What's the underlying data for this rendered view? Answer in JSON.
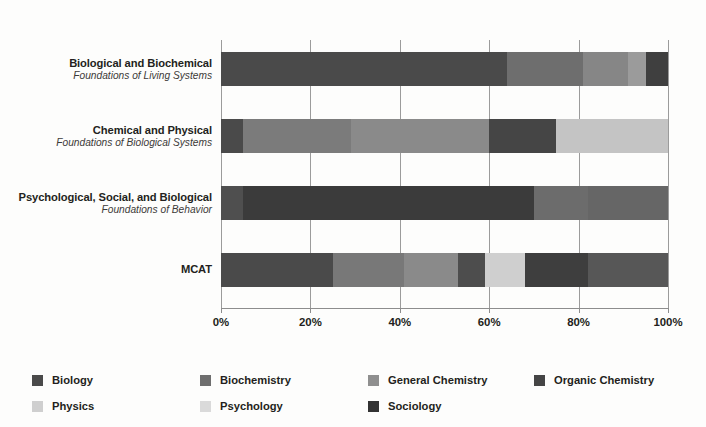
{
  "chart_data": {
    "type": "bar",
    "orientation": "horizontal",
    "stacked": true,
    "normalized": true,
    "title": "",
    "xlabel": "",
    "ylabel": "",
    "xlim": [
      0,
      100
    ],
    "xticks": [
      "0%",
      "20%",
      "40%",
      "60%",
      "80%",
      "100%"
    ],
    "xtick_values": [
      0,
      20,
      40,
      60,
      80,
      100
    ],
    "grid": true,
    "legend_position": "bottom-left",
    "categories": [
      {
        "title": "Biological and Biochemical",
        "subtitle": "Foundations of Living Systems"
      },
      {
        "title": "Chemical and Physical",
        "subtitle": "Foundations of Biological Systems"
      },
      {
        "title": "Psychological, Social, and Biological",
        "subtitle": "Foundations of Behavior"
      },
      {
        "title": "MCAT",
        "subtitle": ""
      }
    ],
    "series": [
      {
        "name": "Biology",
        "color": "#4a4a4a",
        "values": [
          64,
          5,
          5,
          25
        ]
      },
      {
        "name": "Biochemistry",
        "color": "#6e6e6e",
        "values": [
          17,
          24,
          0,
          16
        ]
      },
      {
        "name": "General Chemistry",
        "color": "#8a8a8a",
        "values": [
          10,
          31,
          0,
          12
        ]
      },
      {
        "name": "Organic Chemistry",
        "color": "#4a4a4a",
        "values": [
          0,
          15,
          0,
          6
        ]
      },
      {
        "name": "Physics",
        "color": "#c8c8c8",
        "values": [
          4,
          25,
          0,
          9
        ]
      },
      {
        "name": "Psychology",
        "color": "#d2d2d2",
        "values": [
          0,
          0,
          65,
          14
        ]
      },
      {
        "name": "Sociology",
        "color": "#3a3a3a",
        "values": [
          5,
          0,
          30,
          18
        ]
      }
    ],
    "bars": [
      {
        "category": "Biological and Biochemical",
        "segments": [
          {
            "name": "Biology",
            "value": 64,
            "color": "#4a4a4a"
          },
          {
            "name": "Biochemistry",
            "value": 17,
            "color": "#6e6e6e"
          },
          {
            "name": "General Chemistry",
            "value": 10,
            "color": "#868686"
          },
          {
            "name": "Physics",
            "value": 4,
            "color": "#9b9b9b"
          },
          {
            "name": "Sociology",
            "value": 5,
            "color": "#3f3f3f"
          }
        ]
      },
      {
        "category": "Chemical and Physical",
        "segments": [
          {
            "name": "Biology",
            "value": 5,
            "color": "#4a4a4a"
          },
          {
            "name": "Biochemistry",
            "value": 24,
            "color": "#7b7b7b"
          },
          {
            "name": "General Chemistry",
            "value": 31,
            "color": "#8a8a8a"
          },
          {
            "name": "Organic Chemistry",
            "value": 15,
            "color": "#454545"
          },
          {
            "name": "Physics",
            "value": 25,
            "color": "#c4c4c4"
          }
        ]
      },
      {
        "category": "Psychological, Social, and Biological",
        "segments": [
          {
            "name": "Biology",
            "value": 5,
            "color": "#4f4f4f"
          },
          {
            "name": "Psychology",
            "value": 65,
            "color": "#3b3b3b"
          },
          {
            "name": "Sociology",
            "value": 12,
            "color": "#6c6c6c"
          },
          {
            "name": "Sociology",
            "value": 18,
            "color": "#666666"
          }
        ]
      },
      {
        "category": "MCAT",
        "segments": [
          {
            "name": "Biology",
            "value": 25,
            "color": "#4a4a4a"
          },
          {
            "name": "Biochemistry",
            "value": 16,
            "color": "#787878"
          },
          {
            "name": "General Chemistry",
            "value": 12,
            "color": "#8a8a8a"
          },
          {
            "name": "Organic Chemistry",
            "value": 6,
            "color": "#4d4d4d"
          },
          {
            "name": "Physics",
            "value": 9,
            "color": "#cfcfcf"
          },
          {
            "name": "Psychology",
            "value": 14,
            "color": "#3e3e3e"
          },
          {
            "name": "Sociology",
            "value": 18,
            "color": "#575757"
          }
        ]
      }
    ]
  },
  "legend": {
    "items": [
      {
        "label": "Biology",
        "color": "#4a4a4a"
      },
      {
        "label": "Biochemistry",
        "color": "#6e6e6e"
      },
      {
        "label": "General Chemistry",
        "color": "#8f8f8f"
      },
      {
        "label": "Organic Chemistry",
        "color": "#454545"
      },
      {
        "label": "Physics",
        "color": "#cfcfcf"
      },
      {
        "label": "Psychology",
        "color": "#dadada"
      },
      {
        "label": "Sociology",
        "color": "#333333"
      }
    ]
  },
  "axis": {
    "tick_labels": [
      "0%",
      "20%",
      "40%",
      "60%",
      "80%",
      "100%"
    ]
  }
}
